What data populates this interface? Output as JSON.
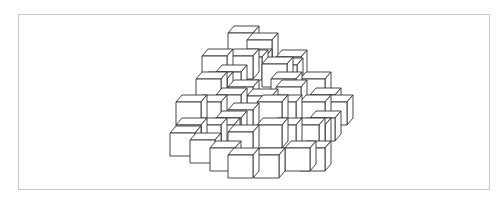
{
  "figure": {
    "frame_color": "#c8c8c8",
    "stroke_color": "#333333",
    "fill_color": "#ffffff"
  },
  "cube_geometry": {
    "width": 25,
    "height": 23,
    "depth_dx": 6,
    "depth_dy": -7
  },
  "cubes": [
    [
      228,
      33
    ],
    [
      247,
      40
    ],
    [
      276,
      57
    ],
    [
      202,
      56
    ],
    [
      228,
      56
    ],
    [
      241,
      56
    ],
    [
      216,
      72
    ],
    [
      237,
      57
    ],
    [
      272,
      65
    ],
    [
      196,
      79
    ],
    [
      202,
      79
    ],
    [
      262,
      64
    ],
    [
      276,
      87
    ],
    [
      300,
      79
    ],
    [
      176,
      102
    ],
    [
      196,
      102
    ],
    [
      216,
      95
    ],
    [
      247,
      96
    ],
    [
      271,
      79
    ],
    [
      176,
      125
    ],
    [
      196,
      125
    ],
    [
      300,
      102
    ],
    [
      310,
      95
    ],
    [
      322,
      102
    ],
    [
      216,
      118
    ],
    [
      271,
      102
    ],
    [
      271,
      125
    ],
    [
      300,
      125
    ],
    [
      310,
      118
    ],
    [
      170,
      133
    ],
    [
      190,
      140
    ],
    [
      209,
      125
    ],
    [
      210,
      148
    ],
    [
      228,
      87
    ],
    [
      228,
      110
    ],
    [
      228,
      132
    ],
    [
      228,
      155
    ],
    [
      257,
      102
    ],
    [
      257,
      125
    ],
    [
      254,
      155
    ],
    [
      285,
      148
    ],
    [
      294,
      125
    ],
    [
      300,
      148
    ]
  ]
}
